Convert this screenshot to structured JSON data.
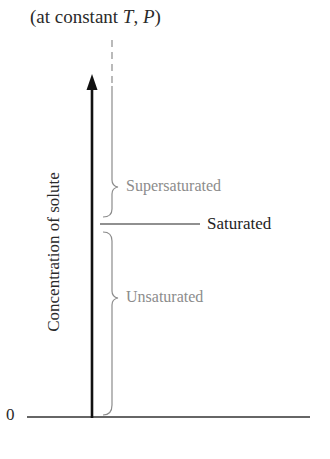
{
  "diagram": {
    "title_prefix": "(at constant ",
    "title_var1": "T",
    "title_sep": ", ",
    "title_var2": "P",
    "title_suffix": ")",
    "y_axis_label": "Concentration of solute",
    "origin_label": "0",
    "regions": [
      {
        "name": "supersaturated",
        "label": "Supersaturated",
        "color": "#8c8c8c"
      },
      {
        "name": "saturated",
        "label": "Saturated",
        "color": "#1e1e1e"
      },
      {
        "name": "unsaturated",
        "label": "Unsaturated",
        "color": "#8c8c8c"
      }
    ]
  }
}
